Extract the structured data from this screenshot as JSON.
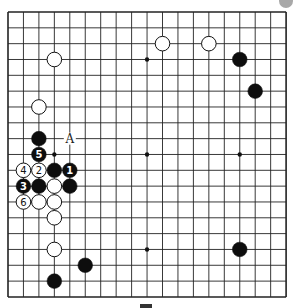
{
  "board": {
    "size": 19,
    "origin": {
      "x": 8,
      "y": 12
    },
    "spacing": {
      "x": 15.45,
      "y": 15.83
    },
    "line_color": "#222222",
    "border_width": 1.6,
    "line_width": 0.9,
    "hoshi": [
      [
        3,
        3
      ],
      [
        9,
        3
      ],
      [
        15,
        3
      ],
      [
        3,
        9
      ],
      [
        9,
        9
      ],
      [
        15,
        9
      ],
      [
        3,
        15
      ],
      [
        9,
        15
      ],
      [
        15,
        15
      ]
    ],
    "stones": [
      {
        "color": "white",
        "col": 10,
        "row": 2
      },
      {
        "color": "white",
        "col": 13,
        "row": 2
      },
      {
        "color": "black",
        "col": 15,
        "row": 3
      },
      {
        "color": "black",
        "col": 16,
        "row": 5
      },
      {
        "color": "white",
        "col": 3,
        "row": 3
      },
      {
        "color": "white",
        "col": 2,
        "row": 6
      },
      {
        "color": "black",
        "col": 2,
        "row": 8
      },
      {
        "color": "black",
        "col": 2,
        "row": 9,
        "label": "5"
      },
      {
        "color": "white",
        "col": 1,
        "row": 10,
        "label": "4"
      },
      {
        "color": "white",
        "col": 2,
        "row": 10,
        "label": "2"
      },
      {
        "color": "black",
        "col": 3,
        "row": 10
      },
      {
        "color": "black",
        "col": 4,
        "row": 10,
        "label": "1"
      },
      {
        "color": "black",
        "col": 1,
        "row": 11,
        "label": "3"
      },
      {
        "color": "black",
        "col": 2,
        "row": 11
      },
      {
        "color": "white",
        "col": 3,
        "row": 11
      },
      {
        "color": "black",
        "col": 4,
        "row": 11
      },
      {
        "color": "white",
        "col": 1,
        "row": 12,
        "label": "6"
      },
      {
        "color": "white",
        "col": 2,
        "row": 12
      },
      {
        "color": "white",
        "col": 3,
        "row": 12
      },
      {
        "color": "white",
        "col": 3,
        "row": 13
      },
      {
        "color": "white",
        "col": 3,
        "row": 15
      },
      {
        "color": "black",
        "col": 15,
        "row": 15
      },
      {
        "color": "black",
        "col": 5,
        "row": 16
      },
      {
        "color": "black",
        "col": 3,
        "row": 17
      }
    ],
    "markers": [
      {
        "label": "A",
        "col": 4,
        "row": 8
      }
    ]
  },
  "caption": {
    "text": "",
    "visible_fragment": true
  }
}
